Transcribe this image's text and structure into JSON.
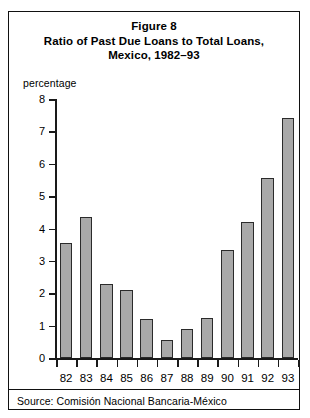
{
  "figure": {
    "title_lines": [
      "Figure 8",
      "Ratio of Past Due Loans to Total Loans,",
      "Mexico, 1982–93"
    ],
    "source": "Source:  Comisión Nacional Bancaria-México"
  },
  "chart_data": {
    "type": "bar",
    "xlabel": "",
    "ylabel": "percentage",
    "categories": [
      "82",
      "83",
      "84",
      "85",
      "86",
      "87",
      "88",
      "89",
      "90",
      "91",
      "92",
      "93"
    ],
    "values": [
      3.55,
      4.35,
      2.3,
      2.1,
      1.2,
      0.55,
      0.9,
      1.25,
      3.35,
      4.2,
      5.55,
      7.4
    ],
    "ylim": [
      0,
      8
    ],
    "yticks": [
      0,
      1,
      2,
      3,
      4,
      5,
      6,
      7,
      8
    ],
    "ytick_labels": [
      "0",
      "1",
      "2",
      "3",
      "4",
      "5",
      "6",
      "7",
      "8"
    ],
    "grid": false,
    "legend": null,
    "bar_color": "#a9a9a9",
    "bar_edge_color": "#2b2b2b",
    "axis_color": "#1a1a1a"
  }
}
